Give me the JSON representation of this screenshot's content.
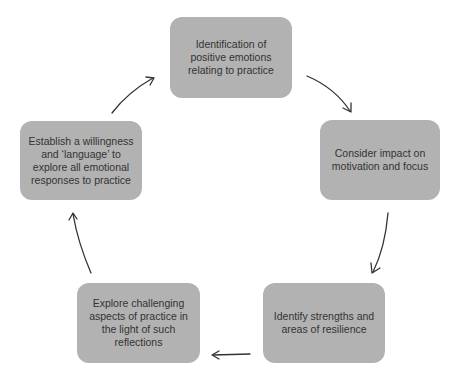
{
  "diagram": {
    "type": "cycle",
    "colors": {
      "box_fill": "#b2b2b2",
      "text": "#333333",
      "arrow": "#333333",
      "background": "#ffffff"
    },
    "steps": [
      {
        "id": 1,
        "label": "Identification of\npositive emotions\nrelating to practice"
      },
      {
        "id": 2,
        "label": "Consider impact on\nmotivation and focus"
      },
      {
        "id": 3,
        "label": "Identify strengths and\nareas of resilience"
      },
      {
        "id": 4,
        "label": "Explore challenging\naspects of practice in\nthe light of such\nreflections"
      },
      {
        "id": 5,
        "label": "Establish a willingness\nand ‘language’ to\nexplore all emotional\nresponses to practice"
      }
    ],
    "arrows": [
      {
        "from": 1,
        "to": 2,
        "icon": "curved-arrow-down-right"
      },
      {
        "from": 2,
        "to": 3,
        "icon": "curved-arrow-down"
      },
      {
        "from": 3,
        "to": 4,
        "icon": "arrow-left"
      },
      {
        "from": 4,
        "to": 5,
        "icon": "curved-arrow-up"
      },
      {
        "from": 5,
        "to": 1,
        "icon": "curved-arrow-up-right"
      }
    ]
  }
}
